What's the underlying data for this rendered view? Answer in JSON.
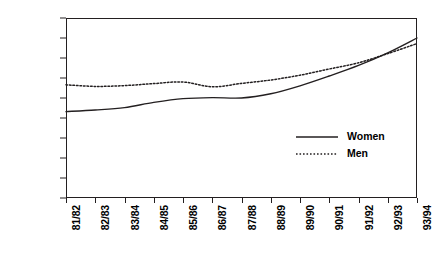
{
  "chart_data": {
    "type": "line",
    "title": "",
    "xlabel": "",
    "ylabel": "",
    "ylim": [
      0,
      900000
    ],
    "grid": false,
    "legend_position": "inside-lower-right",
    "categories": [
      "81/82",
      "82/83",
      "83/84",
      "84/85",
      "85/86",
      "86/87",
      "87/88",
      "88/89",
      "89/90",
      "90/91",
      "91/92",
      "92/93",
      "93/94"
    ],
    "series": [
      {
        "name": "Women",
        "style": "solid",
        "color": "#231f20",
        "values": [
          432000,
          440000,
          452000,
          478000,
          497000,
          502000,
          500000,
          521000,
          561000,
          610000,
          663000,
          726000,
          800000
        ]
      },
      {
        "name": "Men",
        "style": "dotted",
        "color": "#231f20",
        "values": [
          566000,
          558000,
          562000,
          572000,
          580000,
          556000,
          573000,
          590000,
          614000,
          645000,
          676000,
          722000,
          772000
        ]
      }
    ],
    "ytick_labels": [
      "0",
      "100,000",
      "200,000",
      "300,000",
      "400,000",
      "500,000",
      "600,000",
      "700,000",
      "800,000",
      "900,000"
    ],
    "ytick_values": [
      0,
      100000,
      200000,
      300000,
      400000,
      500000,
      600000,
      700000,
      800000,
      900000
    ]
  },
  "legend": {
    "items": [
      {
        "label": "Women",
        "style": "solid"
      },
      {
        "label": "Men",
        "style": "dotted"
      }
    ]
  }
}
